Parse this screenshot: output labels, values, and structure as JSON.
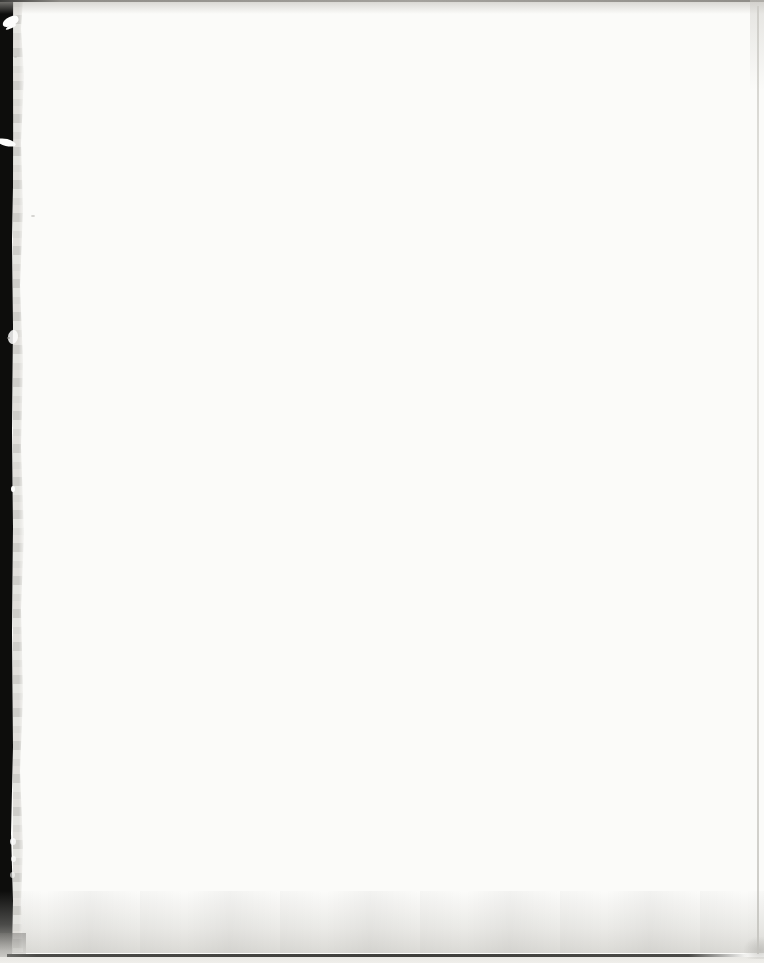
{
  "page": {
    "kind": "scanned blank book page",
    "visible_text": "",
    "orientation": "portrait"
  },
  "colors": {
    "paper": "#fbfbf9",
    "gutter_black": "#0d0d0c",
    "edge_gray": "#d6d5d1",
    "tear_white": "#fdfdfc",
    "top_line": "#8f8d88",
    "bottom_line": "#4a4a47",
    "bottom_shadow": "#e6e5e1",
    "right_line": "#e3e2dd"
  }
}
